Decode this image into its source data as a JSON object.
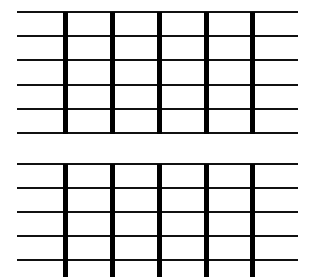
{
  "colors": {
    "background": "#ffffff",
    "line": "#111111",
    "bar": "#000000"
  },
  "blocks": [
    {
      "name": "top-grid",
      "line_x_start": 17,
      "line_x_end": 298,
      "lines_y": [
        12,
        36,
        60,
        85,
        109,
        133
      ],
      "bars_x": [
        63,
        110,
        157,
        204,
        250
      ],
      "bar_y_start": 12,
      "bar_y_end": 134
    },
    {
      "name": "bottom-grid",
      "line_x_start": 17,
      "line_x_end": 298,
      "lines_y": [
        164,
        188,
        212,
        236,
        260
      ],
      "bars_x": [
        63,
        110,
        157,
        204,
        250
      ],
      "bar_y_start": 164,
      "bar_y_end": 277
    }
  ]
}
